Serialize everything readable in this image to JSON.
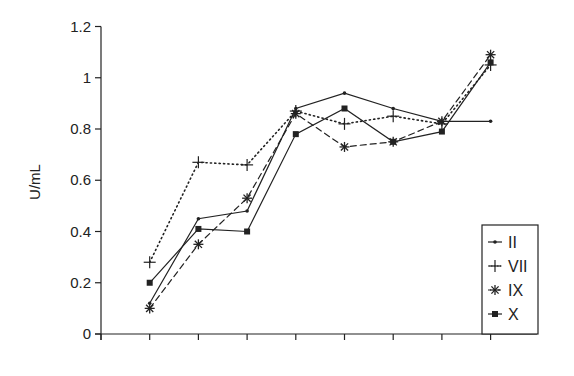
{
  "chart_data": {
    "type": "line",
    "title": "",
    "xlabel": "",
    "ylabel": "U/mL",
    "ylim": [
      0,
      1.2
    ],
    "yticks": [
      0,
      0.2,
      0.4,
      0.6,
      0.8,
      1,
      1.2
    ],
    "ytick_labels": [
      "0",
      "0.2",
      "0.4",
      "0.6",
      "0.8",
      "1",
      "1.2"
    ],
    "x": [
      1,
      2,
      3,
      4,
      5,
      6,
      7,
      8
    ],
    "xtick_labels": [],
    "grid": false,
    "legend_position": "lower right",
    "series": [
      {
        "name": "II",
        "marker": "dot",
        "line": "solid",
        "values": [
          0.12,
          0.45,
          0.48,
          0.88,
          0.94,
          0.88,
          0.83,
          0.83
        ]
      },
      {
        "name": "VII",
        "marker": "plus",
        "line": "dotted",
        "values": [
          0.28,
          0.67,
          0.66,
          0.87,
          0.82,
          0.85,
          0.82,
          1.05
        ]
      },
      {
        "name": "IX",
        "marker": "asterisk",
        "line": "dashed",
        "values": [
          0.1,
          0.35,
          0.53,
          0.86,
          0.73,
          0.75,
          0.83,
          1.09
        ]
      },
      {
        "name": "X",
        "marker": "square",
        "line": "solid",
        "values": [
          0.2,
          0.41,
          0.4,
          0.78,
          0.88,
          0.75,
          0.79,
          1.06
        ]
      }
    ]
  },
  "colors": {
    "ink": "#222222",
    "background": "#ffffff"
  }
}
